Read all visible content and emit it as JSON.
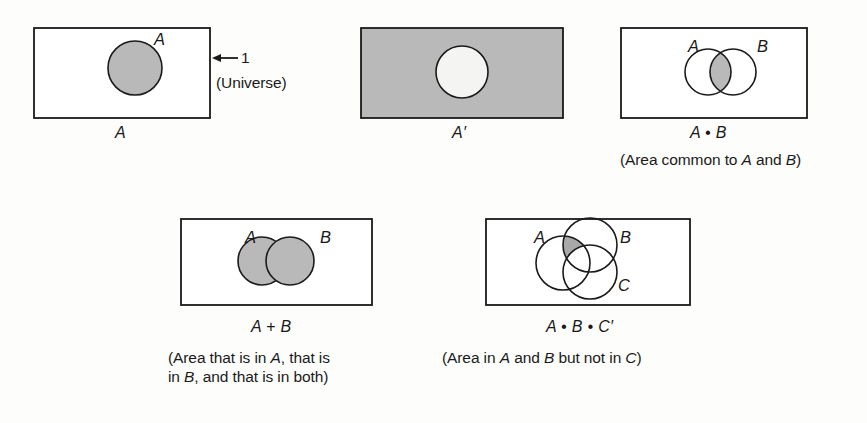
{
  "figure": {
    "ink_color": "#1a1a1a",
    "shade_color": "#b9b9b9",
    "background_color": "#fdfdfc"
  },
  "diagrams": [
    {
      "id": "a",
      "expr": "A",
      "set_labels": [
        "A"
      ],
      "caption": "",
      "annotation": {
        "arrow_label": "1",
        "arrow_note": "(Universe)"
      },
      "shading": "circle-A-filled"
    },
    {
      "id": "a-prime",
      "expr": "A′",
      "set_labels": [],
      "caption": "",
      "shading": "rectangle-filled-circle-empty"
    },
    {
      "id": "a-and-b",
      "expr": "A • B",
      "set_labels": [
        "A",
        "B"
      ],
      "caption": "(Area common to A and B)",
      "caption_parts": [
        {
          "t": "(Area common to ",
          "i": false
        },
        {
          "t": "A",
          "i": true
        },
        {
          "t": " and ",
          "i": false
        },
        {
          "t": "B",
          "i": true
        },
        {
          "t": ")",
          "i": false
        }
      ],
      "shading": "intersection-only"
    },
    {
      "id": "a-or-b",
      "expr": "A + B",
      "set_labels": [
        "A",
        "B"
      ],
      "caption": "(Area that is in A, that is in B, and that is in both)",
      "caption_line1_parts": [
        {
          "t": "(Area that is in ",
          "i": false
        },
        {
          "t": "A",
          "i": true
        },
        {
          "t": ", that is",
          "i": false
        }
      ],
      "caption_line2_parts": [
        {
          "t": "in ",
          "i": false
        },
        {
          "t": "B",
          "i": true
        },
        {
          "t": ", and that is in both)",
          "i": false
        }
      ],
      "shading": "union-filled"
    },
    {
      "id": "a-and-b-not-c",
      "expr": "A • B • C′",
      "set_labels": [
        "A",
        "B",
        "C"
      ],
      "caption": "(Area in A and B but not in C)",
      "caption_parts": [
        {
          "t": "(Area in ",
          "i": false
        },
        {
          "t": "A",
          "i": true
        },
        {
          "t": " and ",
          "i": false
        },
        {
          "t": "B",
          "i": true
        },
        {
          "t": " but not in ",
          "i": false
        },
        {
          "t": "C",
          "i": true
        },
        {
          "t": ")",
          "i": false
        }
      ],
      "shading": "a-and-b-minus-c"
    }
  ]
}
